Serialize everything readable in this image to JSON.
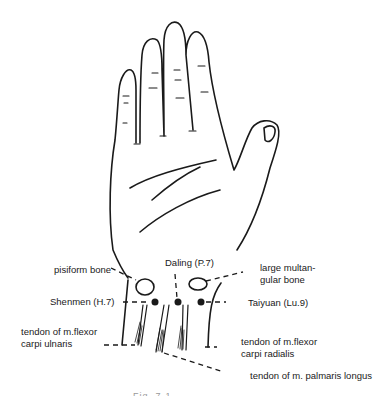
{
  "diagram": {
    "labels": {
      "daling": "Daling (P.7)",
      "pisiform": "pisiform bone",
      "large_multangular_1": "large multan-",
      "large_multangular_2": "gular bone",
      "shenmen": "Shenmen (H.7)",
      "taiyuan": "Taiyuan (Lu.9)",
      "flexor_ulnaris_1": "tendon of m.flexor",
      "flexor_ulnaris_2": "carpi ulnaris",
      "flexor_radialis_1": "tendon of m.flexor",
      "flexor_radialis_2": "carpi radialis",
      "palmaris_longus": "tendon of m.  palmaris longus"
    },
    "caption": "Fig. 7-1",
    "colors": {
      "ink": "#1a1a1a",
      "background": "#ffffff"
    }
  }
}
